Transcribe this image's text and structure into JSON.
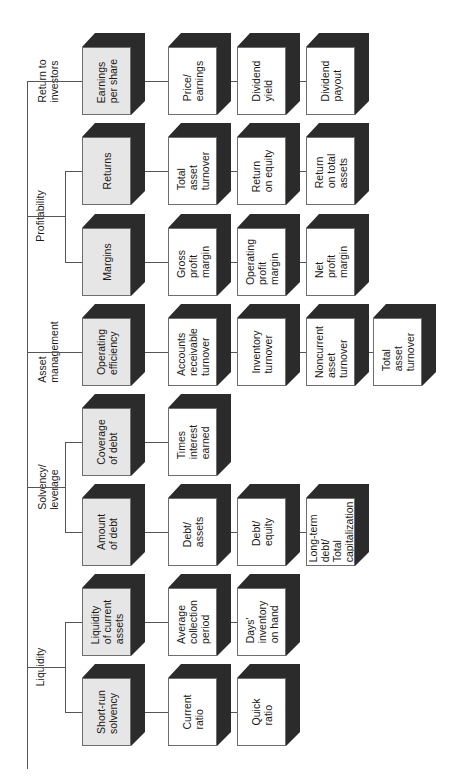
{
  "diagram": {
    "type": "tree",
    "orientation": "rotated-90-ccw",
    "colors": {
      "category_fill": "#e6e6e6",
      "ratio_fill": "#ffffff",
      "shadow": "#2b2b2b",
      "border": "#6e6e6e",
      "connector": "#555555"
    },
    "groups": [
      {
        "label": "Return to\ninvestors",
        "categories": [
          {
            "label": "Earnings\nper share",
            "ratios": [
              "Price/\nearnings",
              "Dividend\nyield",
              "Dividend\npayout"
            ]
          }
        ]
      },
      {
        "label": "Profitability",
        "categories": [
          {
            "label": "Returns",
            "ratios": [
              "Total\nasset\nturnover",
              "Return\non equity",
              "Return\non total\nassets"
            ]
          },
          {
            "label": "Margins",
            "ratios": [
              "Gross\nprofit\nmargin",
              "Operating\nprofit\nmargin",
              "Net\nprofit\nmargin"
            ]
          }
        ]
      },
      {
        "label": "Asset\nmanagement",
        "categories": [
          {
            "label": "Operating\nefficiency",
            "ratios": [
              "Accounts\nreceivable\nturnover",
              "Inventory\nturnover",
              "Noncurrent\nasset\nturnover",
              "Total\nasset\nturnover"
            ]
          }
        ]
      },
      {
        "label": "Solvency/\nleverage",
        "categories": [
          {
            "label": "Coverage\nof debt",
            "ratios": [
              "Times\ninterest\nearned"
            ]
          },
          {
            "label": "Amount\nof debt",
            "ratios": [
              "Debt/\nassets",
              "Debt/\nequity",
              "Long-term\ndebt/\nTotal\ncapitalization"
            ]
          }
        ]
      },
      {
        "label": "Liquidity",
        "categories": [
          {
            "label": "Liquidity\nof current\nassets",
            "ratios": [
              "Average\ncollection\nperiod",
              "Days'\ninventory\non hand"
            ]
          },
          {
            "label": "Short-run\nsolvency",
            "ratios": [
              "Current\nratio",
              "Quick\nratio"
            ]
          }
        ]
      }
    ]
  }
}
